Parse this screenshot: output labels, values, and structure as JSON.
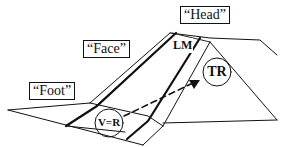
{
  "diagram": {
    "labels": {
      "head": "“Head”",
      "face": "“Face”",
      "foot": "“Foot”"
    },
    "markers": {
      "lm": "LM",
      "tr": "TR",
      "vr": "V=R"
    },
    "colors": {
      "stroke": "#111111",
      "background": "#ffffff"
    }
  }
}
